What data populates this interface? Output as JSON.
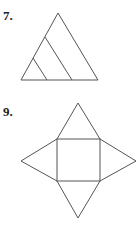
{
  "problems": [
    {
      "number": "7.",
      "figure": "triangle-subdivided"
    },
    {
      "number": "9.",
      "figure": "square-pyramid-net"
    }
  ],
  "colors": {
    "stroke": "#555555",
    "text": "#222222"
  }
}
